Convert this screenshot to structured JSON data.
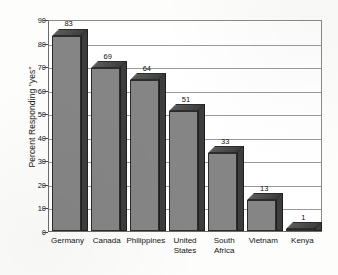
{
  "chart_data": {
    "type": "bar",
    "title": "",
    "subtitle": "",
    "xlabel": "",
    "ylabel": "Percent Responding \"yes\"",
    "categories": [
      "Germany",
      "Canada",
      "Philippines",
      "United States",
      "South Africa",
      "Vietnam",
      "Kenya"
    ],
    "category_lines": [
      [
        "Germany"
      ],
      [
        "Canada"
      ],
      [
        "Philippines"
      ],
      [
        "United",
        "States"
      ],
      [
        "South",
        "Africa"
      ],
      [
        "Vietnam"
      ],
      [
        "Kenya"
      ]
    ],
    "values": [
      83,
      69,
      64,
      51,
      33,
      13,
      1
    ],
    "value_labels": [
      "83",
      "69",
      "64",
      "51",
      "33",
      "13",
      "1"
    ],
    "ylim": [
      0,
      90
    ],
    "ytick_values": [
      0,
      10,
      20,
      30,
      40,
      50,
      60,
      70,
      80,
      90
    ],
    "ytick_labels": [
      "0",
      "10",
      "20",
      "30",
      "40",
      "50",
      "60",
      "70",
      "80",
      "90"
    ],
    "grid": true,
    "legend": false,
    "legend_position": "none",
    "style": "3d-column",
    "colors": {
      "bar_front": "#858585",
      "bar_side": "#3d3d3d",
      "bar_top": "#5a5a5a",
      "bar_outline": "#2c2c2c",
      "gridline": "#9a9a9a",
      "axis": "#6b6b6b",
      "text": "#141414",
      "background": "#fdfdfc"
    }
  }
}
